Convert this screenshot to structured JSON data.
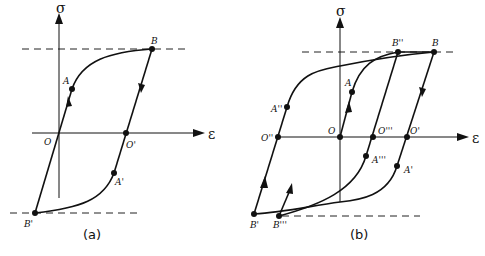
{
  "figure": {
    "panels": [
      {
        "id": "a",
        "caption": "(a)",
        "axes": {
          "y_label": "σ",
          "x_label": "ε"
        },
        "points": {
          "B": "B",
          "A": "A",
          "O": "O",
          "O1": "O'",
          "A1": "A'",
          "B1": "B'"
        }
      },
      {
        "id": "b",
        "caption": "(b)",
        "axes": {
          "y_label": "σ",
          "x_label": "ε"
        },
        "points": {
          "B2": "B''",
          "B": "B",
          "A": "A",
          "A2": "A''",
          "O2": "O''",
          "O": "O",
          "O3": "O'''",
          "O1": "O'",
          "A3": "A'''",
          "A1": "A'",
          "B1": "B'",
          "B3": "B'''"
        }
      }
    ]
  }
}
